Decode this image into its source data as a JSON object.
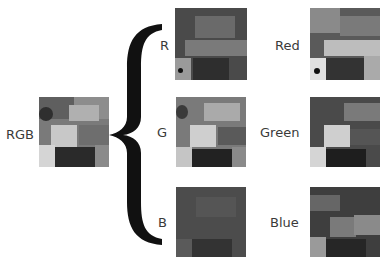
{
  "diagram": {
    "source": {
      "label": "RGB"
    },
    "channels": [
      {
        "short": "R",
        "long": "Red"
      },
      {
        "short": "G",
        "long": "Green"
      },
      {
        "short": "B",
        "long": "Blue"
      }
    ],
    "connector": "curly-brace"
  },
  "colors": {
    "background": "#ffffff",
    "brace": "#111111",
    "text": "#3a3a3a"
  }
}
